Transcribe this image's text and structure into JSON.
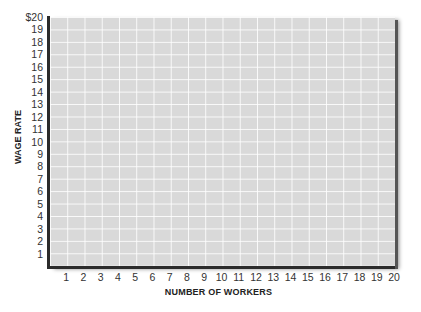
{
  "chart_data": {
    "type": "scatter",
    "title": "",
    "xlabel": "NUMBER OF WORKERS",
    "ylabel": "WAGE RATE",
    "x_ticks": [
      "1",
      "2",
      "3",
      "4",
      "5",
      "6",
      "7",
      "8",
      "9",
      "10",
      "11",
      "12",
      "13",
      "14",
      "15",
      "16",
      "17",
      "18",
      "19",
      "20"
    ],
    "y_ticks": [
      "1",
      "2",
      "3",
      "4",
      "5",
      "6",
      "7",
      "8",
      "9",
      "10",
      "11",
      "12",
      "13",
      "14",
      "15",
      "16",
      "17",
      "18",
      "19",
      "$20"
    ],
    "xlim": [
      0,
      20
    ],
    "ylim": [
      0,
      20
    ],
    "grid": true,
    "series": [],
    "note": "Blank grid for plotting; no data points shown"
  },
  "colors": {
    "plot_background": "#d9d9d9",
    "grid_lines": "#f2f2f2",
    "axis": "#2b2b2b"
  }
}
